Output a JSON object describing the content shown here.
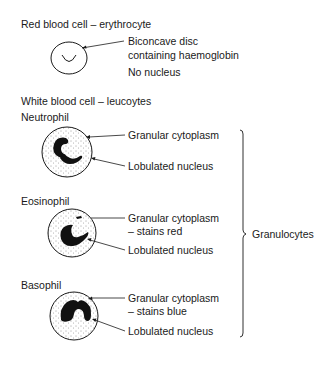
{
  "red_cell": {
    "heading": "Red blood cell – erythrocyte",
    "label_line1": "Biconcave disc",
    "label_line2": "containing haemoglobin",
    "label_nucleus": "No nucleus"
  },
  "white_cells": {
    "heading": "White blood cell – leucoytes",
    "neutrophil": {
      "name": "Neutrophil",
      "cytoplasm": "Granular cytoplasm",
      "nucleus": "Lobulated nucleus"
    },
    "eosinophil": {
      "name": "Eosinophil",
      "cytoplasm_line1": "Granular cytoplasm",
      "cytoplasm_line2": "– stains red",
      "nucleus": "Lobulated nucleus"
    },
    "basophil": {
      "name": "Basophil",
      "cytoplasm_line1": "Granular cytoplasm",
      "cytoplasm_line2": "– stains blue",
      "nucleus": "Lobulated nucleus"
    },
    "group_label": "Granulocytes"
  },
  "colors": {
    "ink": "#1a1a1a",
    "background": "#ffffff"
  }
}
